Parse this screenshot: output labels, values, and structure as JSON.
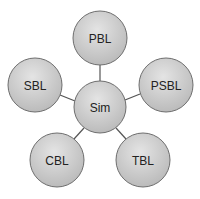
{
  "diagram": {
    "center": {
      "label": "Sim",
      "cx": 100,
      "cy": 107,
      "r": 26
    },
    "nodes": [
      {
        "label": "PBL",
        "cx": 100,
        "cy": 38,
        "r": 27
      },
      {
        "label": "SBL",
        "cx": 35,
        "cy": 85,
        "r": 27
      },
      {
        "label": "PSBL",
        "cx": 166,
        "cy": 85,
        "r": 27
      },
      {
        "label": "CBL",
        "cx": 57,
        "cy": 160,
        "r": 27
      },
      {
        "label": "TBL",
        "cx": 143,
        "cy": 160,
        "r": 27
      }
    ],
    "colors": {
      "fill_light": "#e6e6e6",
      "fill_dark": "#b4b4b4",
      "stroke": "#6e6e6e",
      "edge": "#555555"
    }
  }
}
